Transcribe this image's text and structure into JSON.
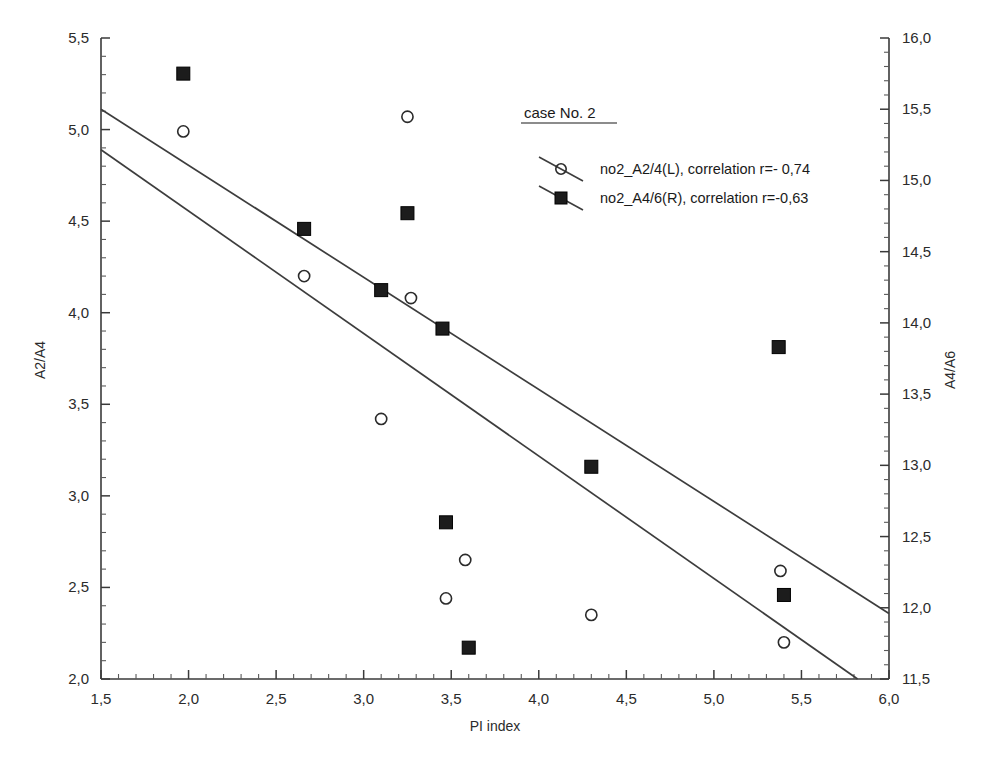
{
  "chart_data": {
    "type": "scatter",
    "title": "case No. 2",
    "xlabel": "PI index",
    "ylabel": "A2/A4",
    "ylabel_right": "A4/A6",
    "xlim": [
      1.5,
      6.0
    ],
    "ylim": [
      2.0,
      5.5
    ],
    "ylim_right": [
      11.5,
      16.0
    ],
    "xticks": [
      "1,5",
      "2,0",
      "2,5",
      "3,0",
      "3,5",
      "4,0",
      "4,5",
      "5,0",
      "5,5",
      "6,0"
    ],
    "xtick_values": [
      1.5,
      2.0,
      2.5,
      3.0,
      3.5,
      4.0,
      4.5,
      5.0,
      5.5,
      6.0
    ],
    "yticks": [
      "2,0",
      "2,5",
      "3,0",
      "3,5",
      "4,0",
      "4,5",
      "5,0",
      "5,5"
    ],
    "ytick_values": [
      2.0,
      2.5,
      3.0,
      3.5,
      4.0,
      4.5,
      5.0,
      5.5
    ],
    "yticks_right": [
      "11,5",
      "12,0",
      "12,5",
      "13,0",
      "13,5",
      "14,0",
      "14,5",
      "15,0",
      "15,5",
      "16,0"
    ],
    "ytick_right_values": [
      11.5,
      12.0,
      12.5,
      13.0,
      13.5,
      14.0,
      14.5,
      15.0,
      15.5,
      16.0
    ],
    "minor_ticks_per_interval": 5,
    "grid": false,
    "legend_position": "upper-right-inside",
    "series": [
      {
        "name": "no2_A2/4(L),  correlation r=- 0,74",
        "marker": "open-circle",
        "axis": "left",
        "correlation": -0.74,
        "points": [
          {
            "x": 1.97,
            "y": 4.99
          },
          {
            "x": 2.66,
            "y": 4.2
          },
          {
            "x": 3.1,
            "y": 3.42
          },
          {
            "x": 3.25,
            "y": 5.07
          },
          {
            "x": 3.27,
            "y": 4.08
          },
          {
            "x": 3.47,
            "y": 2.44
          },
          {
            "x": 3.58,
            "y": 2.65
          },
          {
            "x": 4.3,
            "y": 2.35
          },
          {
            "x": 5.38,
            "y": 2.59
          },
          {
            "x": 5.4,
            "y": 2.2
          }
        ],
        "trend_line": {
          "x1": 1.5,
          "y1": 4.89,
          "x2": 6.0,
          "y2": 1.88
        }
      },
      {
        "name": "no2_A4/6(R),  correlation r=-0,63",
        "marker": "filled-square",
        "axis": "right",
        "correlation": -0.63,
        "points": [
          {
            "x": 1.97,
            "y": 15.75
          },
          {
            "x": 2.66,
            "y": 14.66
          },
          {
            "x": 3.1,
            "y": 14.23
          },
          {
            "x": 3.25,
            "y": 14.77
          },
          {
            "x": 3.45,
            "y": 13.96
          },
          {
            "x": 3.47,
            "y": 12.6
          },
          {
            "x": 3.6,
            "y": 11.72
          },
          {
            "x": 4.3,
            "y": 12.99
          },
          {
            "x": 5.37,
            "y": 13.83
          },
          {
            "x": 5.4,
            "y": 12.09
          }
        ],
        "trend_line": {
          "x1": 1.5,
          "y1": 15.5,
          "x2": 6.0,
          "y2": 11.96
        }
      }
    ]
  }
}
